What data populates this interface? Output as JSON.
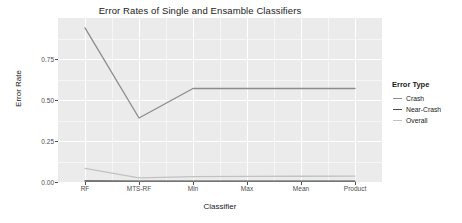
{
  "chart_data": {
    "type": "line",
    "title": "Error Rates of Single and Ensamble Classifiers",
    "xlabel": "Classifier",
    "ylabel": "Error Rate",
    "categories": [
      "RF",
      "MTS-RF",
      "Min",
      "Max",
      "Mean",
      "Product"
    ],
    "ylim": [
      0.0,
      1.0
    ],
    "yticks": [
      "0.00",
      "0.25",
      "0.50",
      "0.75"
    ],
    "ytick_values": [
      0.0,
      0.25,
      0.5,
      0.75
    ],
    "grid": true,
    "legend_position": "right",
    "legend_title": "Error Type",
    "series": [
      {
        "name": "Crash",
        "color": "#8c8c8c",
        "values": [
          0.94,
          0.39,
          0.57,
          0.57,
          0.57,
          0.57
        ]
      },
      {
        "name": "Near-Crash",
        "color": "#4d4d4d",
        "values": [
          0.006,
          0.005,
          0.005,
          0.005,
          0.005,
          0.005
        ]
      },
      {
        "name": "Overall",
        "color": "#c2c2c2",
        "values": [
          0.083,
          0.025,
          0.033,
          0.034,
          0.035,
          0.036
        ]
      }
    ]
  },
  "theme": {
    "panel_background": "#ebebeb",
    "grid_color": "#ffffff",
    "text_color": "#1a1a1a",
    "tick_color": "#4d4d4d",
    "page_background": "#ffffff"
  }
}
